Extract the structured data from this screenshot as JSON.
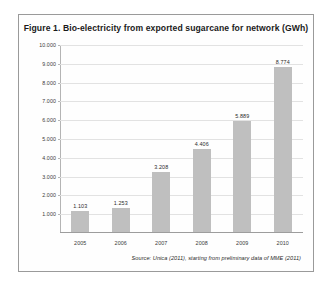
{
  "figure": {
    "title": "Figure 1. Bio-electricity from exported sugarcane for network (GWh)",
    "source_note": "Source: Unica (2011), starting from preliminary data of MME (2011)",
    "bar_color": "#bfbfbf",
    "grid_color": "#e2e2e2",
    "frame_color": "#9a9a9a"
  },
  "chart_data": {
    "type": "bar",
    "title": "Figure 1. Bio-electricity from exported sugarcane for network (GWh)",
    "xlabel": "",
    "ylabel": "",
    "categories": [
      "2005",
      "2006",
      "2007",
      "2008",
      "2009",
      "2010"
    ],
    "values": [
      1103,
      1253,
      3208,
      4406,
      5889,
      8774
    ],
    "value_labels": [
      "1.103",
      "1.253",
      "3.208",
      "4.406",
      "5.889",
      "8.774"
    ],
    "ylim": [
      0,
      10000
    ],
    "ytick_values": [
      1000,
      2000,
      3000,
      4000,
      5000,
      6000,
      7000,
      8000,
      9000,
      10000
    ],
    "ytick_labels": [
      "1.000",
      "2.000",
      "3.000",
      "4.000",
      "5.000",
      "6.000",
      "7.000",
      "8.000",
      "9.000",
      "10.000"
    ],
    "grid": true,
    "legend": false
  }
}
